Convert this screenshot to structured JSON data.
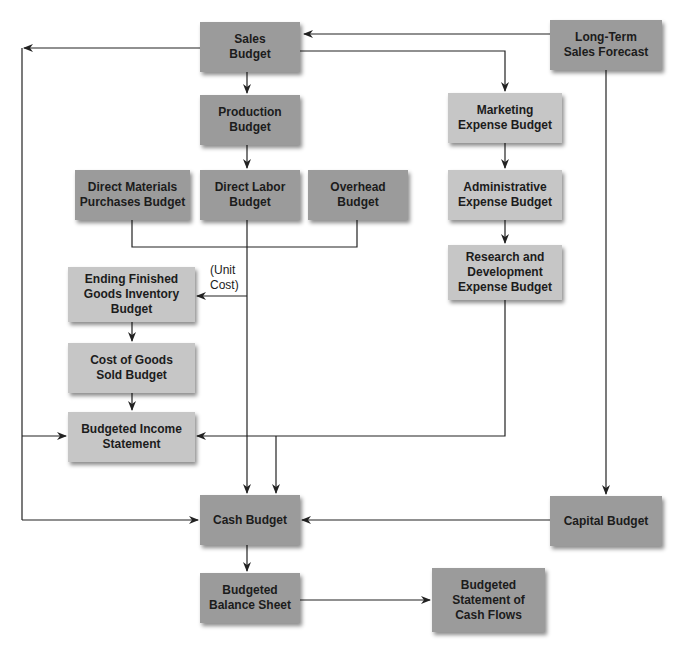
{
  "diagram": {
    "type": "flowchart",
    "title": "",
    "colors": {
      "background": "#ffffff",
      "operating_box": "#9b9b9b",
      "expense_box": "#c6c6c6",
      "line": "#222222"
    },
    "nodes": {
      "sales_budget": "Sales\nBudget",
      "long_term_sales_forecast": "Long-Term\nSales Forecast",
      "production_budget": "Production\nBudget",
      "marketing_expense_budget": "Marketing\nExpense Budget",
      "direct_materials_purchases_budget": "Direct Materials\nPurchases Budget",
      "direct_labor_budget": "Direct Labor\nBudget",
      "overhead_budget": "Overhead\nBudget",
      "administrative_expense_budget": "Administrative\nExpense Budget",
      "research_development_expense_budget": "Research and\nDevelopment\nExpense Budget",
      "ending_finished_goods_inventory_budget": "Ending Finished\nGoods Inventory\nBudget",
      "cost_of_goods_sold_budget": "Cost of Goods\nSold Budget",
      "budgeted_income_statement": "Budgeted Income\nStatement",
      "cash_budget": "Cash Budget",
      "capital_budget": "Capital Budget",
      "budgeted_balance_sheet": "Budgeted\nBalance Sheet",
      "budgeted_statement_of_cash_flows": "Budgeted\nStatement of\nCash Flows"
    },
    "annotations": {
      "unit_cost": "(Unit\nCost)"
    },
    "edges": [
      {
        "from": "Long-Term Sales Forecast",
        "to": "Sales Budget"
      },
      {
        "from": "Long-Term Sales Forecast",
        "to": "Capital Budget"
      },
      {
        "from": "Sales Budget",
        "to": "Production Budget"
      },
      {
        "from": "Sales Budget",
        "to": "Marketing Expense Budget"
      },
      {
        "from": "Sales Budget",
        "to": "Budgeted Income Statement"
      },
      {
        "from": "Sales Budget",
        "to": "Cash Budget"
      },
      {
        "from": "Production Budget",
        "to": "Direct Labor Budget"
      },
      {
        "from": "Direct Materials Purchases Budget",
        "to": "Ending Finished Goods Inventory Budget",
        "label": "(Unit Cost)"
      },
      {
        "from": "Direct Labor Budget",
        "to": "Ending Finished Goods Inventory Budget",
        "label": "(Unit Cost)"
      },
      {
        "from": "Overhead Budget",
        "to": "Ending Finished Goods Inventory Budget",
        "label": "(Unit Cost)"
      },
      {
        "from": "Direct Labor Budget",
        "to": "Cash Budget"
      },
      {
        "from": "Ending Finished Goods Inventory Budget",
        "to": "Cost of Goods Sold Budget"
      },
      {
        "from": "Cost of Goods Sold Budget",
        "to": "Budgeted Income Statement"
      },
      {
        "from": "Marketing Expense Budget",
        "to": "Administrative Expense Budget"
      },
      {
        "from": "Administrative Expense Budget",
        "to": "Research and Development Expense Budget"
      },
      {
        "from": "Research and Development Expense Budget",
        "to": "Budgeted Income Statement"
      },
      {
        "from": "Research and Development Expense Budget",
        "to": "Cash Budget"
      },
      {
        "from": "Capital Budget",
        "to": "Cash Budget"
      },
      {
        "from": "Cash Budget",
        "to": "Budgeted Balance Sheet"
      },
      {
        "from": "Budgeted Balance Sheet",
        "to": "Budgeted Statement of Cash Flows"
      }
    ]
  }
}
